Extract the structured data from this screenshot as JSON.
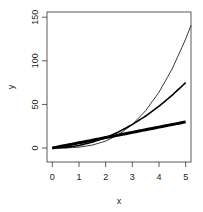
{
  "chart_data": {
    "type": "line",
    "title": "",
    "xlabel": "x",
    "ylabel": "y",
    "xlim": [
      -0.2,
      5.2
    ],
    "ylim": [
      -16,
      156
    ],
    "x_ticks": [
      0,
      1,
      2,
      3,
      4,
      5
    ],
    "x_tick_labels": [
      "0",
      "1",
      "2",
      "3",
      "4",
      "5"
    ],
    "y_ticks": [
      0,
      50,
      100,
      150
    ],
    "y_tick_labels": [
      "0",
      "50",
      "100",
      "150"
    ],
    "grid": false,
    "legend": null,
    "series": [
      {
        "name": "x^3",
        "line_weight": "thin",
        "color": "#000000",
        "x": [
          0,
          0.5,
          1,
          1.5,
          2,
          2.5,
          3,
          3.5,
          4,
          4.5,
          5,
          5.2
        ],
        "y": [
          0,
          0.125,
          1,
          3.375,
          8,
          15.625,
          27,
          42.875,
          64,
          91.125,
          125,
          140.6
        ]
      },
      {
        "name": "3x^2",
        "line_weight": "medium",
        "color": "#000000",
        "x": [
          0,
          0.5,
          1,
          1.5,
          2,
          2.5,
          3,
          3.5,
          4,
          4.5,
          5
        ],
        "y": [
          0,
          0.75,
          3,
          6.75,
          12,
          18.75,
          27,
          36.75,
          48,
          60.75,
          75
        ]
      },
      {
        "name": "6x",
        "line_weight": "thick",
        "color": "#000000",
        "x": [
          0,
          1,
          2,
          3,
          4,
          5
        ],
        "y": [
          0,
          6,
          12,
          18,
          24,
          30
        ]
      }
    ]
  }
}
